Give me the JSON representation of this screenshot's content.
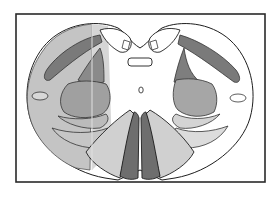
{
  "diagram": {
    "type": "spinal-cord-cross-section",
    "frame": {
      "x": 16,
      "y": 14,
      "width": 249,
      "height": 168
    },
    "colors": {
      "outline": "#1e1e1e",
      "frame": "#2a2a2a",
      "background": "#ffffff",
      "light_fill": "#cfcfcf",
      "mid_fill": "#a6a6a6",
      "dark_fill": "#7a7a7a",
      "highlight_overlay": "#bdbdbd"
    },
    "regions": [
      {
        "id": "left-lateral-highlight",
        "shade": "light"
      },
      {
        "id": "left-corticospinal-tract",
        "shade": "dark"
      },
      {
        "id": "right-corticospinal-tract",
        "shade": "dark"
      },
      {
        "id": "left-ventral-horn",
        "shade": "mid"
      },
      {
        "id": "right-ventral-horn",
        "shade": "mid"
      },
      {
        "id": "left-dorsal-horn",
        "shade": "dark"
      },
      {
        "id": "right-dorsal-horn",
        "shade": "dark"
      },
      {
        "id": "central-canal",
        "shade": "white"
      },
      {
        "id": "left-anterior-column-lateral",
        "shade": "light"
      },
      {
        "id": "right-anterior-column-lateral",
        "shade": "light"
      },
      {
        "id": "left-anterior-column-medial",
        "shade": "dark"
      },
      {
        "id": "right-anterior-column-medial",
        "shade": "dark"
      },
      {
        "id": "dorsal-columns",
        "shade": "white"
      }
    ]
  }
}
